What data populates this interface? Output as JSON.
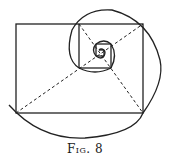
{
  "figure": {
    "caption": "Fig. 8",
    "colors": {
      "stroke": "#222222",
      "background": "#ffffff"
    }
  }
}
